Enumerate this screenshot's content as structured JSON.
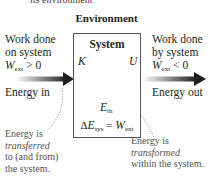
{
  "header": {
    "cut_off_text": "its environment",
    "environment_title": "Environment"
  },
  "left": {
    "line1": "Work done",
    "line2": "on system",
    "w_var": "W",
    "w_sub": "ext",
    "w_cond": " > 0",
    "energy_label": "Energy in",
    "note_line1": "Energy is",
    "note_line2": "transferred",
    "note_line3": "to (and from)",
    "note_line4": "the system."
  },
  "right": {
    "line1": "Work done",
    "line2": "by system",
    "w_var": "W",
    "w_sub": "ext",
    "w_cond": " < 0",
    "energy_label": "Energy out",
    "note_line1": "Energy is",
    "note_line2": "transformed",
    "note_line3": "within the system."
  },
  "system": {
    "title": "System",
    "k": "K",
    "u": "U",
    "eth_var": "E",
    "eth_sub": "th",
    "eq_delta": "Δ",
    "eq_var": "E",
    "eq_sub": "sys",
    "eq_mid": " = ",
    "eq_rhs_var": "W",
    "eq_rhs_sub": "ext"
  },
  "colors": {
    "arrow_dark": "#231f20",
    "arrow_gray": "#a7a9ac",
    "box_border": "#555555",
    "dotted": "#6d6e71"
  }
}
